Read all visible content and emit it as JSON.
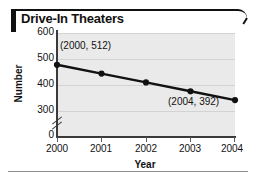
{
  "figure": {
    "title": "Drive-In Theaters"
  },
  "chart_data": {
    "type": "line",
    "title": "Drive-In Theaters",
    "xlabel": "Year",
    "ylabel": "Number",
    "categories": [
      "2000",
      "2001",
      "2002",
      "2003",
      "2004"
    ],
    "x": [
      2000,
      2001,
      2002,
      2003,
      2004
    ],
    "values": [
      512,
      482,
      452,
      422,
      392
    ],
    "series": [
      {
        "name": "Drive-In Theaters",
        "values": [
          512,
          482,
          452,
          422,
          392
        ]
      }
    ],
    "xlim": [
      2000,
      2004
    ],
    "ylim": [
      270,
      620
    ],
    "ytick_labels": [
      "600",
      "500",
      "400",
      "300",
      "0"
    ],
    "ytick_values": [
      600,
      500,
      400,
      300,
      0
    ],
    "xtick_labels": [
      "2000",
      "2001",
      "2002",
      "2003",
      "2004"
    ],
    "grid": true,
    "legend": "none",
    "axis_break": "y-axis break between 0 and 300",
    "annotations": [
      {
        "label": "(2000, 512)",
        "x": 2000,
        "y": 512
      },
      {
        "label": "(2004, 392)",
        "x": 2004,
        "y": 392
      }
    ],
    "colors": {
      "line": "#111111",
      "marker": "#111111",
      "plot_background": "#eaeaea",
      "gridline": "#d3d3d3",
      "axis": "#3a3a3a",
      "text": "#111111",
      "accent": "#111111"
    }
  }
}
